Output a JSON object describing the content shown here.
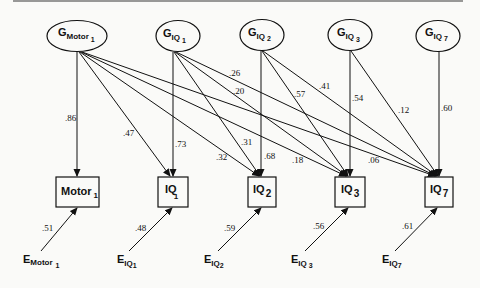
{
  "diagram": {
    "type": "structural-equation-model",
    "latent_factors": [
      {
        "id": "GMotor1",
        "main": "G",
        "sub": "Motor",
        "subsub": "1"
      },
      {
        "id": "GIQ1",
        "main": "G",
        "sub": "IQ",
        "subsub": "1"
      },
      {
        "id": "GIQ2",
        "main": "G",
        "sub": "IQ",
        "subsub": "2"
      },
      {
        "id": "GIQ3",
        "main": "G",
        "sub": "IQ",
        "subsub": "3"
      },
      {
        "id": "GIQ7",
        "main": "G",
        "sub": "IQ",
        "subsub": "7"
      }
    ],
    "observed": [
      {
        "id": "Motor1",
        "main": "Motor",
        "sub": "1"
      },
      {
        "id": "IQ1",
        "main": "IQ",
        "sub": "1"
      },
      {
        "id": "IQ2",
        "main": "IQ",
        "sub": "2"
      },
      {
        "id": "IQ3",
        "main": "IQ",
        "sub": "3"
      },
      {
        "id": "IQ7",
        "main": "IQ",
        "sub": "7"
      }
    ],
    "errors": [
      {
        "id": "EMotor1",
        "main": "E",
        "sub": "Motor",
        "subsub": "1",
        "loading": ".51"
      },
      {
        "id": "EIQ1",
        "main": "E",
        "sub": "IQ",
        "subsub": "1",
        "loading": ".48"
      },
      {
        "id": "EIQ2",
        "main": "E",
        "sub": "IQ",
        "subsub": "2",
        "loading": ".59"
      },
      {
        "id": "EIQ3",
        "main": "E",
        "sub": "IQ",
        "subsub": "3",
        "loading": ".56"
      },
      {
        "id": "EIQ7",
        "main": "E",
        "sub": "IQ",
        "subsub": "7",
        "loading": ".61"
      }
    ],
    "paths": [
      {
        "from": "GMotor1",
        "to": "Motor1",
        "weight": ".86"
      },
      {
        "from": "GMotor1",
        "to": "IQ1",
        "weight": ".47"
      },
      {
        "from": "GMotor1",
        "to": "IQ2",
        "weight": ".32"
      },
      {
        "from": "GMotor1",
        "to": "IQ3",
        "weight": ".18"
      },
      {
        "from": "GMotor1",
        "to": "IQ7",
        "weight": ".06"
      },
      {
        "from": "GIQ1",
        "to": "IQ1",
        "weight": ".73"
      },
      {
        "from": "GIQ1",
        "to": "IQ2",
        "weight": ".31"
      },
      {
        "from": "GIQ1",
        "to": "IQ3",
        "weight": ".20"
      },
      {
        "from": "GIQ1",
        "to": "IQ7",
        "weight": ".26"
      },
      {
        "from": "GIQ2",
        "to": "IQ2",
        "weight": ".68"
      },
      {
        "from": "GIQ2",
        "to": "IQ3",
        "weight": ".57"
      },
      {
        "from": "GIQ2",
        "to": "IQ7",
        "weight": ".41"
      },
      {
        "from": "GIQ3",
        "to": "IQ3",
        "weight": ".54"
      },
      {
        "from": "GIQ3",
        "to": "IQ7",
        "weight": ".12"
      },
      {
        "from": "GIQ7",
        "to": "IQ7",
        "weight": ".60"
      }
    ]
  }
}
